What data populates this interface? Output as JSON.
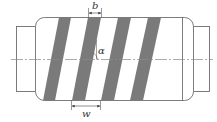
{
  "diagram": {
    "labels": {
      "stripe_width": "b",
      "helix_angle": "α",
      "pitch": "w"
    },
    "colors": {
      "stripe_fill": "#7a7a7a",
      "outline": "#6e6e6e",
      "centerline": "#8a8a8a",
      "background": "#ffffff"
    },
    "stripe_count": 4
  }
}
